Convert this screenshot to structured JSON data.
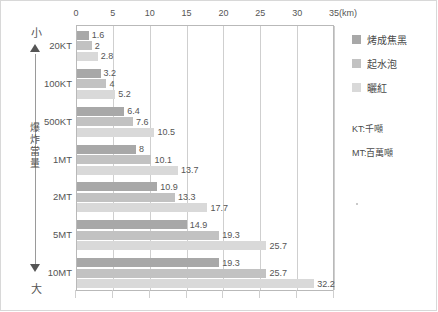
{
  "frame": {
    "ghost_title": ""
  },
  "yield_axis": {
    "top_label": "小",
    "bottom_label": "大",
    "name_chars": [
      "爆",
      "炸",
      "當",
      "量"
    ],
    "name": "爆炸當量"
  },
  "legend": {
    "items": [
      {
        "label": "烤成焦黑",
        "color": "#a8a8a8",
        "key": "charred"
      },
      {
        "label": "起水泡",
        "color": "#c2c2c2",
        "key": "blister"
      },
      {
        "label": "曬紅",
        "color": "#d9d9d9",
        "key": "sunburn"
      }
    ],
    "abbreviations": [
      {
        "text": "KT:千噸"
      },
      {
        "text": "MT:百萬噸"
      }
    ]
  },
  "chart_data": {
    "type": "bar",
    "orientation": "horizontal",
    "title": "",
    "xlabel": "(km)",
    "ylabel": "爆炸當量",
    "xlim": [
      0,
      35
    ],
    "xticks": [
      0,
      5,
      10,
      15,
      20,
      25,
      30,
      35
    ],
    "xtick_labels": [
      "0",
      "5",
      "10",
      "15",
      "20",
      "25",
      "30",
      "35"
    ],
    "x_unit": "(km)",
    "grid": true,
    "legend_position": "right",
    "categories": [
      "20KT",
      "100KT",
      "500KT",
      "1MT",
      "2MT",
      "5MT",
      "10MT"
    ],
    "series": [
      {
        "name": "烤成焦黑",
        "color": "#a8a8a8",
        "values": [
          1.6,
          3.2,
          6.4,
          8,
          10.9,
          14.9,
          19.3
        ],
        "labels": [
          "1.6",
          "3.2",
          "6.4",
          "8",
          "10.9",
          "14.9",
          "19.3"
        ]
      },
      {
        "name": "起水泡",
        "color": "#c2c2c2",
        "values": [
          2,
          4,
          7.6,
          10.1,
          13.3,
          19.3,
          25.7
        ],
        "labels": [
          "2",
          "4",
          "7.6",
          "10.1",
          "13.3",
          "19.3",
          "25.7"
        ]
      },
      {
        "name": "曬紅",
        "color": "#d9d9d9",
        "values": [
          2.8,
          5.2,
          10.5,
          13.7,
          17.7,
          25.7,
          32.2
        ],
        "labels": [
          "2.8",
          "5.2",
          "10.5",
          "13.7",
          "17.7",
          "25.7",
          "32.2"
        ]
      }
    ]
  }
}
